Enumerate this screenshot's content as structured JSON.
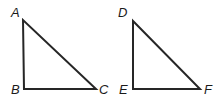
{
  "figure": {
    "background_color": "#ffffff",
    "stroke_color": "#262626",
    "stroke_width": 2,
    "label_color": "#1a1a1a"
  },
  "triangles": [
    {
      "name": "triangle-abc",
      "vertices": [
        {
          "id": "A",
          "label": "A",
          "x": 23,
          "y": 20,
          "label_x": 11,
          "label_y": 6
        },
        {
          "id": "B",
          "label": "B",
          "x": 24,
          "y": 89,
          "label_x": 11,
          "label_y": 83
        },
        {
          "id": "C",
          "label": "C",
          "x": 96,
          "y": 89,
          "label_x": 99,
          "label_y": 83
        }
      ],
      "points": "23,20 24,89 96,89"
    },
    {
      "name": "triangle-def",
      "vertices": [
        {
          "id": "D",
          "label": "D",
          "x": 133,
          "y": 21,
          "label_x": 118,
          "label_y": 6
        },
        {
          "id": "E",
          "label": "E",
          "x": 133,
          "y": 89,
          "label_x": 119,
          "label_y": 83
        },
        {
          "id": "F",
          "label": "F",
          "x": 200,
          "y": 89,
          "label_x": 204,
          "label_y": 83
        }
      ],
      "points": "133,21 133,89 200,89"
    }
  ]
}
